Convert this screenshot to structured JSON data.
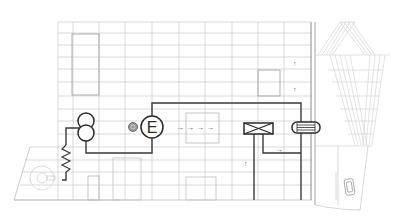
{
  "diagram": {
    "title": "",
    "colors": {
      "background": "#ffffff",
      "grid": "#c8c8c8",
      "outline": "#bdbdbd",
      "conduit": "#3a3a3a",
      "symbol": "#2a2a2a",
      "faint": "#d4d4d4"
    },
    "components": {
      "transformer": {
        "name": "transformer",
        "symbol": "double-circle"
      },
      "generator": {
        "name": "generator",
        "label": "E"
      },
      "meter": {
        "name": "small-meter",
        "label": ""
      },
      "heat_exchanger": {
        "name": "heat-exchanger",
        "symbol": "boxed-x"
      },
      "storage_tank": {
        "name": "storage-tank",
        "symbol": "rounded-hatched"
      },
      "resistor": {
        "name": "ground-resistor",
        "symbol": "zigzag"
      },
      "fan": {
        "name": "fan-unit",
        "symbol": "circle"
      },
      "flow_arrows": [
        "→",
        "→",
        "→",
        "→"
      ],
      "right_arrow_label": "→",
      "up_arrows": [
        "↑",
        "↑",
        "↑"
      ]
    }
  }
}
